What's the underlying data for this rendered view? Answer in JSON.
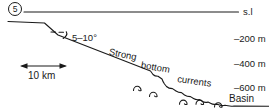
{
  "figure_label": "5",
  "sea_level_label": "s.l",
  "depth_labels": [
    "–200 m",
    "–400 m",
    "–600 m"
  ],
  "angle_label": "5–10°",
  "slope_annotation": {
    "words": [
      "Strong",
      "bottom",
      "currents"
    ]
  },
  "scale_bar_label": "10 km",
  "basin_label": "Basin",
  "colors": {
    "ink": "#1a1a1a",
    "background": "#ffffff"
  }
}
